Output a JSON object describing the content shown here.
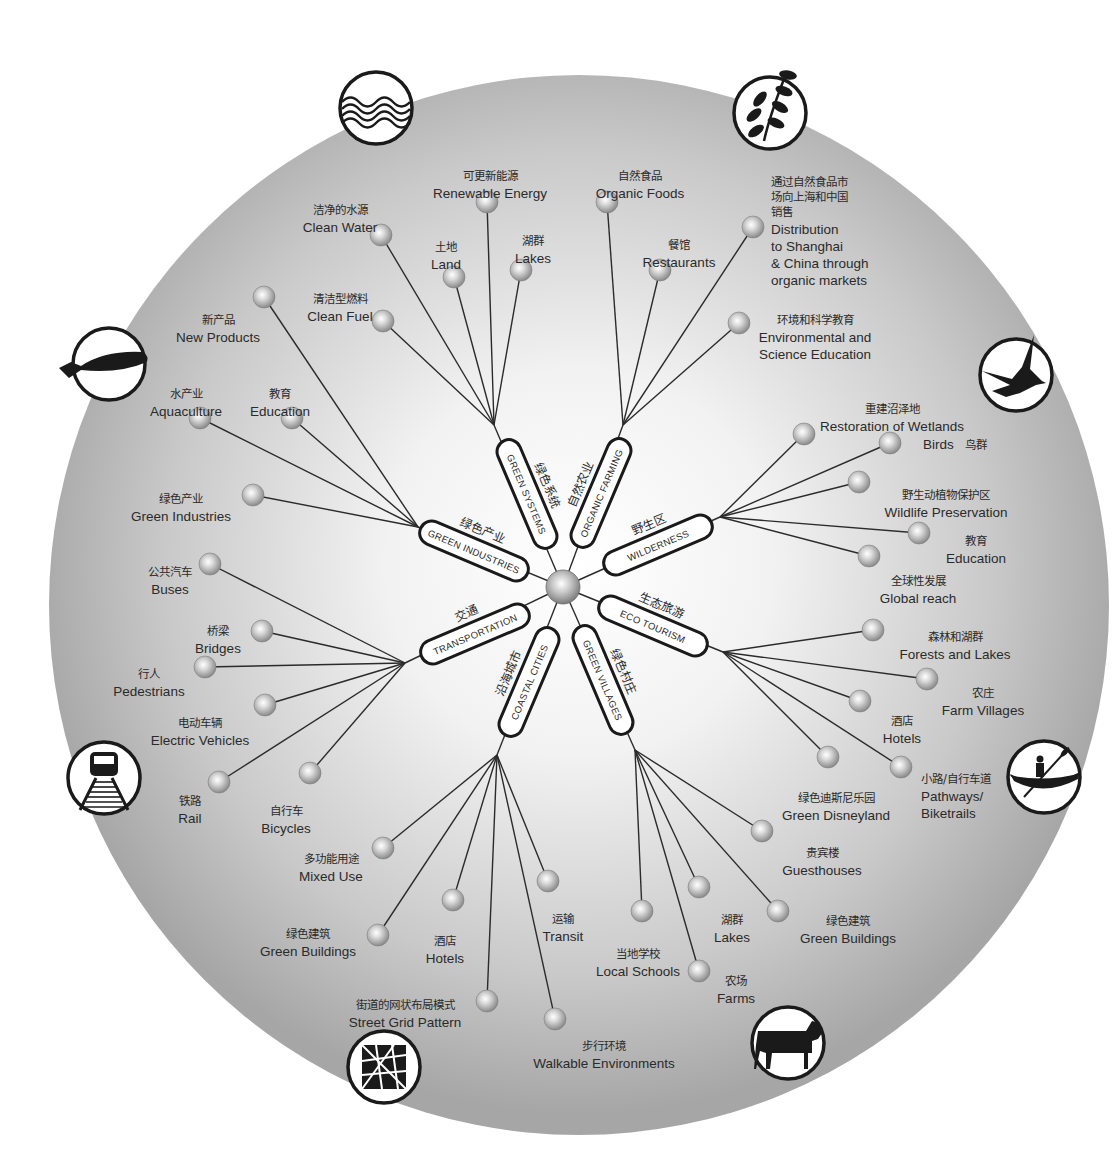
{
  "colors": {
    "disc_center": "#ffffff",
    "disc_edge": "#a9a9a9",
    "ink": "#1a1a1a",
    "node_light": "#f4f4f4",
    "node_dark": "#8c8c8c",
    "text": "#2a2a2a"
  },
  "hub": {
    "x": 563,
    "y": 587
  },
  "categories": [
    {
      "id": "green-systems",
      "en": "GREEN SYSTEMS",
      "zh": "绿色系统",
      "angle": -113,
      "junction": [
        494,
        425
      ],
      "items": [
        {
          "en": "Clean Water",
          "zh": "洁净的水源",
          "node": [
            381,
            235
          ],
          "label": [
            340,
            214
          ],
          "anchor": "middle"
        },
        {
          "en": "Renewable Energy",
          "zh": "可更新能源",
          "node": [
            487,
            202
          ],
          "label": [
            490,
            180
          ],
          "anchor": "middle"
        },
        {
          "en": "Land",
          "zh": "土地",
          "node": [
            454,
            277
          ],
          "label": [
            446,
            251
          ],
          "anchor": "middle"
        },
        {
          "en": "Lakes",
          "zh": "湖群",
          "node": [
            521,
            270
          ],
          "label": [
            533,
            245
          ],
          "anchor": "middle"
        },
        {
          "en": "Clean Fuel",
          "zh": "清洁型燃料",
          "node": [
            383,
            321
          ],
          "label": [
            340,
            303
          ],
          "anchor": "middle"
        }
      ]
    },
    {
      "id": "organic-farming",
      "en": "ORGANIC FARMING",
      "zh": "自然农业",
      "angle": -68,
      "junction": [
        623,
        425
      ],
      "items": [
        {
          "en": "Organic Foods",
          "zh": "自然食品",
          "node": [
            607,
            202
          ],
          "label": [
            640,
            180
          ],
          "anchor": "middle"
        },
        {
          "en": "Restaurants",
          "zh": "餐馆",
          "node": [
            660,
            270
          ],
          "label": [
            679,
            249
          ],
          "anchor": "middle"
        },
        {
          "en": "Distribution to Shanghai & China through organic markets",
          "zh": "通过自然食品市场向上海和中国销售",
          "lines_en": [
            "Distribution",
            "to Shanghai",
            "& China through",
            "organic markets"
          ],
          "lines_zh": [
            "通过自然食品市",
            "场向上海和中国",
            "销售"
          ],
          "node": [
            753,
            227
          ],
          "label": [
            771,
            186
          ],
          "anchor": "start"
        },
        {
          "en": "Environmental and Science Education",
          "zh": "环境和科学教育",
          "lines_en": [
            "Environmental and",
            "Science Education"
          ],
          "node": [
            739,
            323
          ],
          "label": [
            815,
            324
          ],
          "anchor": "middle"
        }
      ]
    },
    {
      "id": "wilderness",
      "en": "WILDERNESS",
      "zh": "野生区",
      "angle": -22,
      "junction": [
        720,
        517
      ],
      "items": [
        {
          "en": "Restoration of Wetlands",
          "zh": "重建沼泽地",
          "node": [
            804,
            434
          ],
          "label": [
            892,
            413
          ],
          "anchor": "middle"
        },
        {
          "en": "Birds",
          "zh": "鸟群",
          "node": [
            890,
            443
          ],
          "label": [
            923,
            449
          ],
          "anchor": "start",
          "inline": true
        },
        {
          "en": "Wildlife Preservation",
          "zh": "野生动植物保护区",
          "node": [
            859,
            482
          ],
          "label": [
            946,
            499
          ],
          "anchor": "middle"
        },
        {
          "en": "Education",
          "zh": "教育",
          "node": [
            919,
            533
          ],
          "label": [
            976,
            545
          ],
          "anchor": "middle"
        },
        {
          "en": "Global reach",
          "zh": "全球性发展",
          "node": [
            869,
            556
          ],
          "label": [
            918,
            585
          ],
          "anchor": "middle"
        }
      ]
    },
    {
      "id": "eco-tourism",
      "en": "ECO TOURISM",
      "zh": "生态旅游",
      "angle": 22,
      "junction": [
        723,
        652
      ],
      "items": [
        {
          "en": "Forests and Lakes",
          "zh": "森林和湖群",
          "node": [
            873,
            630
          ],
          "label": [
            955,
            641
          ],
          "anchor": "middle"
        },
        {
          "en": "Farm Villages",
          "zh": "农庄",
          "node": [
            927,
            679
          ],
          "label": [
            983,
            697
          ],
          "anchor": "middle"
        },
        {
          "en": "Hotels",
          "zh": "酒店",
          "node": [
            860,
            701
          ],
          "label": [
            902,
            725
          ],
          "anchor": "middle"
        },
        {
          "en": "Green Disneyland",
          "zh": "绿色迪斯尼乐园",
          "node": [
            828,
            757
          ],
          "label": [
            836,
            802
          ],
          "anchor": "middle"
        },
        {
          "en": "Pathways/ Biketrails",
          "zh": "小路/自行车道",
          "lines_en": [
            "Pathways/",
            "Biketrails"
          ],
          "node": [
            901,
            767
          ],
          "label": [
            921,
            783
          ],
          "anchor": "start"
        }
      ]
    },
    {
      "id": "green-villages",
      "en": "GREEN VILLAGES",
      "zh": "绿色村庄",
      "angle": 68,
      "junction": [
        635,
        750
      ],
      "items": [
        {
          "en": "Guesthouses",
          "zh": "贵宾楼",
          "node": [
            762,
            831
          ],
          "label": [
            822,
            857
          ],
          "anchor": "middle"
        },
        {
          "en": "Lakes",
          "zh": "湖群",
          "node": [
            699,
            887
          ],
          "label": [
            732,
            924
          ],
          "anchor": "middle"
        },
        {
          "en": "Green Buildings",
          "zh": "绿色建筑",
          "node": [
            778,
            911
          ],
          "label": [
            848,
            925
          ],
          "anchor": "middle"
        },
        {
          "en": "Local Schools",
          "zh": "当地学校",
          "node": [
            642,
            911
          ],
          "label": [
            638,
            958
          ],
          "anchor": "middle"
        },
        {
          "en": "Farms",
          "zh": "农场",
          "node": [
            699,
            971
          ],
          "label": [
            736,
            985
          ],
          "anchor": "middle"
        }
      ]
    },
    {
      "id": "coastal-cities",
      "en": "COASTAL CITIES",
      "zh": "沿海城市",
      "angle": 113,
      "junction": [
        497,
        755
      ],
      "items": [
        {
          "en": "Mixed Use",
          "zh": "多功能用途",
          "node": [
            383,
            848
          ],
          "label": [
            331,
            863
          ],
          "anchor": "middle"
        },
        {
          "en": "Transit",
          "zh": "运输",
          "node": [
            548,
            881
          ],
          "label": [
            563,
            923
          ],
          "anchor": "middle"
        },
        {
          "en": "Hotels",
          "zh": "酒店",
          "node": [
            453,
            900
          ],
          "label": [
            445,
            945
          ],
          "anchor": "middle"
        },
        {
          "en": "Green Buildings",
          "zh": "绿色建筑",
          "node": [
            378,
            935
          ],
          "label": [
            308,
            938
          ],
          "anchor": "middle"
        },
        {
          "en": "Street Grid Pattern",
          "zh": "街道的网状布局模式",
          "node": [
            487,
            1001
          ],
          "label": [
            405,
            1009
          ],
          "anchor": "middle"
        },
        {
          "en": "Walkable Environments",
          "zh": "步行环境",
          "node": [
            555,
            1019
          ],
          "label": [
            604,
            1050
          ],
          "anchor": "middle"
        }
      ]
    },
    {
      "id": "transportation",
      "en": "TRANSPORTATION",
      "zh": "交通",
      "angle": 158,
      "junction": [
        405,
        663
      ],
      "items": [
        {
          "en": "Buses",
          "zh": "公共汽车",
          "node": [
            210,
            564
          ],
          "label": [
            170,
            576
          ],
          "anchor": "middle"
        },
        {
          "en": "Bridges",
          "zh": "桥梁",
          "node": [
            262,
            631
          ],
          "label": [
            218,
            635
          ],
          "anchor": "middle"
        },
        {
          "en": "Pedestrians",
          "zh": "行人",
          "node": [
            205,
            667
          ],
          "label": [
            149,
            678
          ],
          "anchor": "middle"
        },
        {
          "en": "Electric Vehicles",
          "zh": "电动车辆",
          "node": [
            265,
            705
          ],
          "label": [
            200,
            727
          ],
          "anchor": "middle"
        },
        {
          "en": "Rail",
          "zh": "铁路",
          "node": [
            219,
            782
          ],
          "label": [
            190,
            805
          ],
          "anchor": "middle"
        },
        {
          "en": "Bicycles",
          "zh": "自行车",
          "node": [
            310,
            773
          ],
          "label": [
            286,
            815
          ],
          "anchor": "middle"
        }
      ]
    },
    {
      "id": "green-industries",
      "en": "GREEN INDUSTRIES",
      "zh": "绿色产业",
      "angle": -158,
      "junction": [
        418,
        527
      ],
      "items": [
        {
          "en": "New Products",
          "zh": "新产品",
          "node": [
            264,
            297
          ],
          "label": [
            218,
            324
          ],
          "anchor": "middle"
        },
        {
          "en": "Aquaculture",
          "zh": "水产业",
          "node": [
            200,
            418
          ],
          "label": [
            186,
            398
          ],
          "anchor": "middle"
        },
        {
          "en": "Education",
          "zh": "教育",
          "node": [
            292,
            418
          ],
          "label": [
            280,
            398
          ],
          "anchor": "middle"
        },
        {
          "en": "Green Industries",
          "zh": "绿色产业",
          "node": [
            253,
            495
          ],
          "label": [
            181,
            503
          ],
          "anchor": "middle"
        }
      ]
    }
  ],
  "pills": [
    {
      "cx": 527,
      "cy": 494,
      "rot": 67
    },
    {
      "cx": 601,
      "cy": 493,
      "rot": -67
    },
    {
      "cx": 658,
      "cy": 545,
      "rot": -23
    },
    {
      "cx": 653,
      "cy": 626,
      "rot": 23
    },
    {
      "cx": 603,
      "cy": 680,
      "rot": 67
    },
    {
      "cx": 529,
      "cy": 682,
      "rot": -67
    },
    {
      "cx": 475,
      "cy": 634,
      "rot": -23
    },
    {
      "cx": 474,
      "cy": 551,
      "rot": 23
    }
  ],
  "icons": [
    {
      "name": "water-waves-icon",
      "x": 376,
      "y": 108
    },
    {
      "name": "leaf-branch-icon",
      "x": 770,
      "y": 113
    },
    {
      "name": "bird-icon",
      "x": 1016,
      "y": 375
    },
    {
      "name": "kayak-icon",
      "x": 1044,
      "y": 777
    },
    {
      "name": "cow-icon",
      "x": 788,
      "y": 1043
    },
    {
      "name": "street-grid-icon",
      "x": 384,
      "y": 1067
    },
    {
      "name": "train-icon",
      "x": 104,
      "y": 778
    },
    {
      "name": "fish-icon",
      "x": 109,
      "y": 364
    }
  ]
}
